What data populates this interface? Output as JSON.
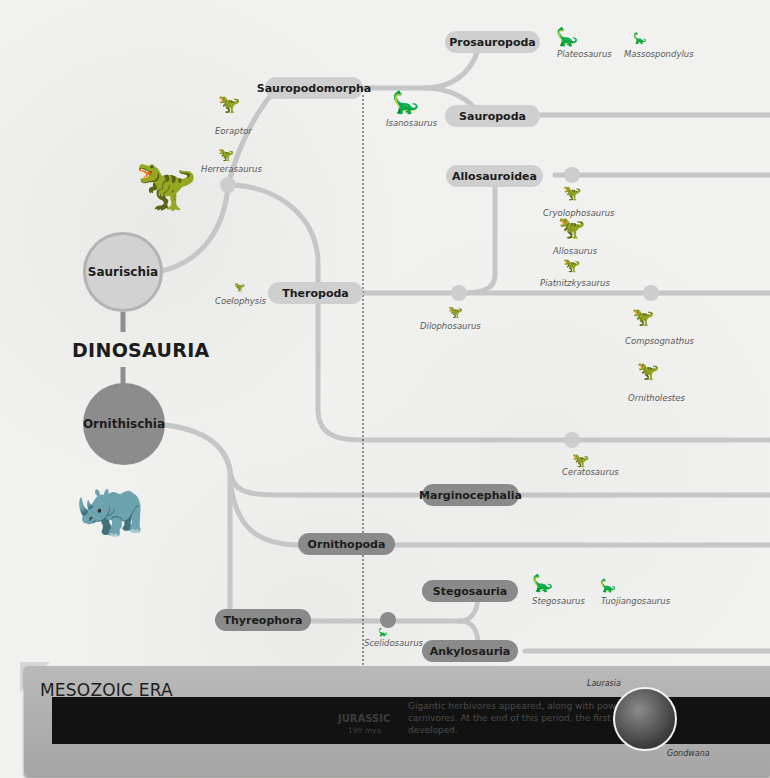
{
  "title": "DINOSAURIA",
  "colors": {
    "saurischia_fill": "#cfcfcf",
    "saurischia_ring": "#b5b5b5",
    "ornithischia_fill": "#8a8a8a",
    "branch_line": "#c4c4c4",
    "era_band": "#121212",
    "era_bg": "#afafaf"
  },
  "major_groups": {
    "saurischia": "Saurischia",
    "ornithischia": "Ornithischia"
  },
  "clades": {
    "sauropodomorpha": "Sauropodomorpha",
    "prosauropoda": "Prosauropoda",
    "sauropoda": "Sauropoda",
    "theropoda": "Theropoda",
    "allosauroidea": "Allosauroidea",
    "marginocephalia": "Marginocephalia",
    "ornithopoda": "Ornithopoda",
    "thyreophora": "Thyreophora",
    "stegosauria": "Stegosauria",
    "ankylosauria": "Ankylosauria"
  },
  "species": {
    "plateosaurus": "Plateosaurus",
    "massospondylus": "Massospondylus",
    "isanosaurus": "Isanosaurus",
    "eoraptor": "Eoraptor",
    "herrerasaurus": "Herrerasaurus",
    "coelophysis": "Coelophysis",
    "cryolophosaurus": "Cryolophosaurus",
    "allosaurus": "Allosaurus",
    "piatnitzkysaurus": "Piatnitzkysaurus",
    "dilophosaurus": "Dilophosaurus",
    "compsognathus": "Compsognathus",
    "ornitholestes": "Ornitholestes",
    "ceratosaurus": "Ceratosaurus",
    "stegosaurus": "Stegosaurus",
    "tuojiangosaurus": "Tuojiangosaurus",
    "scelidosaurus": "Scelidosaurus"
  },
  "era": {
    "title": "MESOZOIC ERA",
    "period": "JURASSIC",
    "period_sub": "199 mya",
    "description": "Gigantic herbivores appeared, along with powerful carnivores. At the end of this period, the first birds developed.",
    "globe_labels": {
      "north": "Laurasia",
      "south": "Gondwana"
    }
  }
}
